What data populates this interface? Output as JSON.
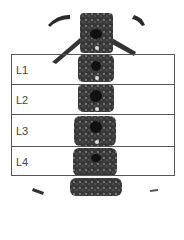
{
  "image": {
    "subject": "lumbar-spine-dxa-scan",
    "colors": {
      "bone": "#2a2a2a",
      "roi_border": "#555555",
      "label": "#444444",
      "background": "#ffffff"
    }
  },
  "regions": [
    {
      "label": "L1",
      "top": 0,
      "height": 30
    },
    {
      "label": "L2",
      "top": 30,
      "height": 30
    },
    {
      "label": "L3",
      "top": 60,
      "height": 32
    },
    {
      "label": "L4",
      "top": 92,
      "height": 30
    }
  ]
}
